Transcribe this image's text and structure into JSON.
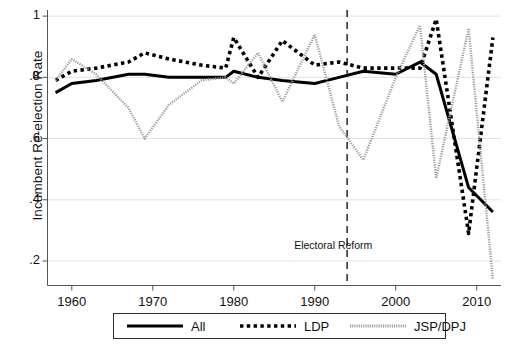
{
  "chart_data": {
    "type": "line",
    "title": "",
    "xlabel": "",
    "ylabel": "Incumbent Re-election Rate",
    "xlim": [
      1957,
      2013
    ],
    "ylim": [
      0.12,
      1.02
    ],
    "xticks": [
      1960,
      1970,
      1980,
      1990,
      2000,
      2010
    ],
    "xticklabels": [
      "1960",
      "1970",
      "1980",
      "1990",
      "2000",
      "2010"
    ],
    "yticks": [
      0.2,
      0.4,
      0.6,
      0.8,
      1.0
    ],
    "yticklabels": [
      ".2",
      ".4",
      ".6",
      ".8",
      "1"
    ],
    "grid": "horizontal",
    "legend_position": "below-axes",
    "annotations": [
      {
        "text": "Electoral Reform",
        "x": 1994,
        "y": 0.25,
        "type": "vline-label"
      }
    ],
    "vlines": [
      {
        "x": 1994,
        "style": "dashed",
        "color": "#333333"
      }
    ],
    "series": [
      {
        "name": "All",
        "style": "solid",
        "color": "#000000",
        "width": 3.0,
        "x": [
          1958,
          1960,
          1963,
          1967,
          1969,
          1972,
          1976,
          1979,
          1980,
          1983,
          1986,
          1990,
          1993,
          1996,
          2000,
          2003,
          2005,
          2009,
          2012
        ],
        "values": [
          0.75,
          0.78,
          0.79,
          0.81,
          0.81,
          0.8,
          0.8,
          0.8,
          0.82,
          0.8,
          0.79,
          0.78,
          0.8,
          0.82,
          0.81,
          0.85,
          0.81,
          0.44,
          0.36
        ]
      },
      {
        "name": "LDP",
        "style": "dotted",
        "color": "#000000",
        "width": 3.6,
        "x": [
          1958,
          1960,
          1963,
          1967,
          1969,
          1972,
          1976,
          1979,
          1980,
          1983,
          1986,
          1990,
          1993,
          1996,
          2000,
          2003,
          2005,
          2009,
          2012
        ],
        "values": [
          0.79,
          0.82,
          0.83,
          0.85,
          0.88,
          0.86,
          0.84,
          0.83,
          0.93,
          0.8,
          0.92,
          0.84,
          0.85,
          0.83,
          0.83,
          0.83,
          0.99,
          0.29,
          0.93
        ]
      },
      {
        "name": "JSP/DPJ",
        "style": "fine-dotted",
        "color": "#9a9a9a",
        "width": 2.4,
        "x": [
          1958,
          1960,
          1963,
          1967,
          1969,
          1972,
          1976,
          1979,
          1980,
          1983,
          1986,
          1990,
          1993,
          1996,
          2000,
          2003,
          2005,
          2009,
          2012
        ],
        "values": [
          0.79,
          0.86,
          0.81,
          0.7,
          0.6,
          0.71,
          0.79,
          0.8,
          0.78,
          0.88,
          0.72,
          0.94,
          0.64,
          0.53,
          0.8,
          0.97,
          0.47,
          0.96,
          0.14
        ]
      }
    ]
  },
  "legend": {
    "items": [
      {
        "label": "All",
        "style": "solid"
      },
      {
        "label": "LDP",
        "style": "dotted"
      },
      {
        "label": "JSP/DPJ",
        "style": "fine-dotted"
      }
    ]
  },
  "axes": {
    "y_title": "Incumbent Re-election Rate"
  }
}
